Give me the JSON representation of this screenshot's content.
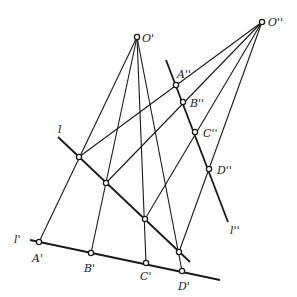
{
  "diagram": {
    "centers": [
      {
        "id": "O1",
        "label": "O'",
        "x": 137,
        "y": 37
      },
      {
        "id": "O2",
        "label": "O''",
        "x": 262,
        "y": 22
      }
    ],
    "lines": [
      {
        "id": "l",
        "label": "l",
        "x1": 58,
        "y1": 137,
        "x2": 190,
        "y2": 262,
        "label_x": 58,
        "label_y": 133
      },
      {
        "id": "l1",
        "label": "l'",
        "x1": 30,
        "y1": 240,
        "x2": 220,
        "y2": 280,
        "label_x": 14,
        "label_y": 243
      },
      {
        "id": "l2",
        "label": "l''",
        "x1": 166,
        "y1": 60,
        "x2": 228,
        "y2": 222,
        "label_x": 230,
        "label_y": 234
      }
    ],
    "points_on_l": [
      {
        "x": 79,
        "y": 157
      },
      {
        "x": 106,
        "y": 183
      },
      {
        "x": 145,
        "y": 219
      },
      {
        "x": 179,
        "y": 252
      }
    ],
    "points_on_l1": [
      {
        "label": "A'",
        "x": 39,
        "y": 242,
        "label_x": 32,
        "label_y": 262
      },
      {
        "label": "B'",
        "x": 91,
        "y": 253,
        "label_x": 84,
        "label_y": 272
      },
      {
        "label": "C'",
        "x": 146,
        "y": 263,
        "label_x": 140,
        "label_y": 280
      },
      {
        "label": "D'",
        "x": 182,
        "y": 271,
        "label_x": 178,
        "label_y": 290
      }
    ],
    "points_on_l2": [
      {
        "label": "A''",
        "x": 176,
        "y": 85,
        "label_x": 177,
        "label_y": 78
      },
      {
        "label": "B''",
        "x": 183,
        "y": 102,
        "label_x": 190,
        "label_y": 107
      },
      {
        "label": "C''",
        "x": 195,
        "y": 132,
        "label_x": 203,
        "label_y": 137
      },
      {
        "label": "D''",
        "x": 209,
        "y": 169,
        "label_x": 217,
        "label_y": 174
      }
    ]
  }
}
